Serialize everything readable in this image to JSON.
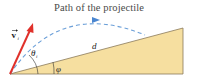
{
  "figure": {
    "title": "Path of the projectile",
    "labels": {
      "velocity": "v",
      "velocity_subscript": "i",
      "theta": "θ",
      "theta_subscript": "i",
      "phi": "φ",
      "distance": "d"
    },
    "colors": {
      "wedge_fill": "#f6dfa0",
      "wedge_stroke": "#8a7a5a",
      "velocity_arrow": "#e0312b",
      "path": "#6b9fd8",
      "text": "#222222"
    }
  }
}
